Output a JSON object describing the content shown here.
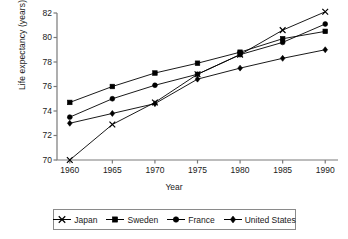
{
  "chart_data": {
    "type": "line",
    "title": "",
    "xlabel": "Year",
    "ylabel": "Life expectancy (years)",
    "x": [
      1960,
      1965,
      1970,
      1975,
      1980,
      1985,
      1990
    ],
    "xticklabels": [
      "1960",
      "1965",
      "1970",
      "1975",
      "1980",
      "1985",
      "1990"
    ],
    "yticklabels": [
      "70",
      "72",
      "74",
      "76",
      "78",
      "80",
      "82"
    ],
    "yticks": [
      70,
      72,
      74,
      76,
      78,
      80,
      82
    ],
    "xlim": [
      1958.5,
      1991.5
    ],
    "ylim": [
      70,
      82
    ],
    "grid": false,
    "legend_position": "bottom",
    "series": [
      {
        "name": "Japan",
        "marker": "x",
        "values": [
          70.0,
          72.9,
          74.7,
          77.0,
          78.6,
          80.6,
          82.1
        ]
      },
      {
        "name": "Sweden",
        "marker": "square",
        "values": [
          74.7,
          76.0,
          77.1,
          77.9,
          78.8,
          79.9,
          80.5
        ]
      },
      {
        "name": "France",
        "marker": "circle",
        "values": [
          73.5,
          75.0,
          76.1,
          77.0,
          78.6,
          79.6,
          81.1
        ]
      },
      {
        "name": "United States",
        "marker": "diamond",
        "values": [
          73.0,
          73.8,
          74.6,
          76.6,
          77.5,
          78.3,
          79.0
        ]
      }
    ]
  },
  "legend": {
    "items": [
      {
        "label": "Japan"
      },
      {
        "label": "Sweden"
      },
      {
        "label": "France"
      },
      {
        "label": "United States"
      }
    ]
  },
  "colors": {
    "line": "#000000",
    "axis": "#7a7a7a",
    "text": "#1a1a1a",
    "background": "#ffffff"
  }
}
